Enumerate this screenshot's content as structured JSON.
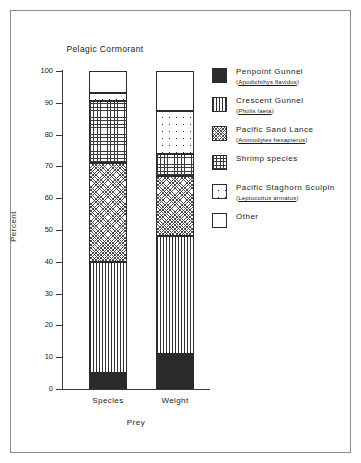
{
  "chart_data": {
    "type": "bar",
    "subtype": "stacked-bar-100",
    "title": "Pelagic Cormorant",
    "xlabel": "Prey",
    "ylabel": "Percent",
    "categories": [
      "Species",
      "Weight"
    ],
    "ylim": [
      0,
      100
    ],
    "yticks": [
      0,
      10,
      20,
      30,
      40,
      50,
      60,
      70,
      80,
      90,
      100
    ],
    "grid": false,
    "legend_position": "right",
    "series": [
      {
        "name": "Penpoint Gunnel",
        "scientific_name": "Apodichthys flavidus",
        "pattern": "solid-black",
        "values": [
          5,
          11
        ]
      },
      {
        "name": "Crescent Gunnel",
        "scientific_name": "Pholis laeta",
        "pattern": "vertical-lines",
        "values": [
          35,
          37
        ]
      },
      {
        "name": "Pacific Sand Lance",
        "scientific_name": "Ammodytes hexapterus",
        "pattern": "diagonal-crosshatch",
        "values": [
          31,
          19
        ]
      },
      {
        "name": "Shrimp species",
        "scientific_name": "",
        "pattern": "fine-grid",
        "values": [
          19.5,
          7
        ]
      },
      {
        "name": "Pacific Staghorn Sculpin",
        "scientific_name": "Leptocottus armatus",
        "pattern": "sparse-dots",
        "values": [
          2.5,
          13.5
        ]
      },
      {
        "name": "Other",
        "scientific_name": "",
        "pattern": "white",
        "values": [
          7,
          12.5
        ]
      }
    ]
  },
  "legend": {
    "items": [
      {
        "label": "Penpoint Gunnel",
        "sci_open": "(",
        "sci": "Apodichthys flavidus",
        "sci_close": ")"
      },
      {
        "label": "Crescent Gunnel",
        "sci_open": "(",
        "sci": "Pholis laeta",
        "sci_close": ")"
      },
      {
        "label": "Pacific Sand Lance",
        "sci_open": "(",
        "sci": "Ammodytes hexapterus",
        "sci_close": ")"
      },
      {
        "label": "Shrimp species",
        "sci_open": "",
        "sci": "",
        "sci_close": ""
      },
      {
        "label": "Pacific Staghorn Sculpin",
        "sci_open": "(",
        "sci": "Leptocottus armatus",
        "sci_close": ")"
      },
      {
        "label": "Other",
        "sci_open": "",
        "sci": "",
        "sci_close": ""
      }
    ]
  },
  "axes": {
    "ytick_labels": [
      "0",
      "10",
      "20",
      "30",
      "40",
      "50",
      "60",
      "70",
      "80",
      "90",
      "100"
    ],
    "xtick_labels": [
      "Species",
      "Weight"
    ]
  },
  "colors": {
    "ink": "#2b2b2b",
    "frame": "#8c8c8c",
    "fill_dark": "#2a2a2a",
    "background": "#ffffff"
  }
}
